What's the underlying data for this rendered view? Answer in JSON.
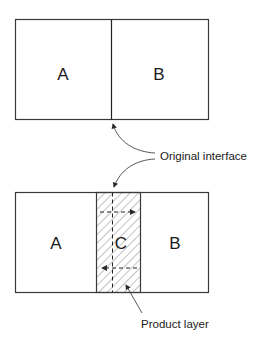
{
  "diagram": {
    "top": {
      "left_label": "A",
      "right_label": "B"
    },
    "bottom": {
      "left_label": "A",
      "middle_label": "C",
      "right_label": "B"
    },
    "annotations": {
      "interface": "Original interface",
      "layer": "Product layer"
    },
    "colors": {
      "stroke": "#3a3a3a",
      "hatch": "#555555",
      "text": "#1a1a1a"
    }
  }
}
